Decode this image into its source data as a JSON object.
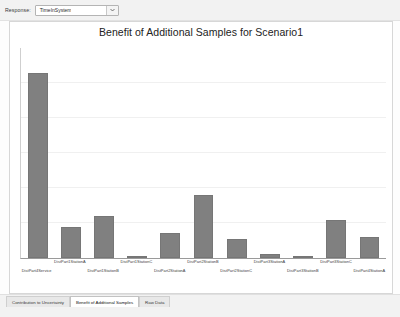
{
  "toolbar": {
    "response_label": "Response:",
    "response_value": "TimeInSystem",
    "dropdown_icon": "chevron-down-icon"
  },
  "chart_data": {
    "type": "bar",
    "title": "Benefit of Additional Samples for Scenario1",
    "xlabel": "",
    "ylabel": "",
    "grid": true,
    "legend": "none",
    "ylim": [
      0,
      100
    ],
    "categories": [
      "DistPart4Service",
      "DistPart1StationA",
      "DistPart1StationB",
      "DistPart1StationC",
      "DistPart2StationA",
      "DistPart2StationB",
      "DistPart2StationC",
      "DistPart3StationA",
      "DistPart3StationB",
      "DistPart3StationC",
      "DistPart4StationA"
    ],
    "values": [
      88,
      15,
      20,
      1,
      12,
      30,
      9,
      2,
      0.8,
      18,
      10
    ]
  },
  "tabs": [
    {
      "label": "Contribution to Uncertainty",
      "active": false
    },
    {
      "label": "Benefit of Additional Samples",
      "active": true
    },
    {
      "label": "Raw Data",
      "active": false
    }
  ],
  "colors": {
    "bar": "#808080",
    "bar_border": "#767676",
    "panel": "#f2f2f2",
    "plot_background": "#ffffff"
  }
}
